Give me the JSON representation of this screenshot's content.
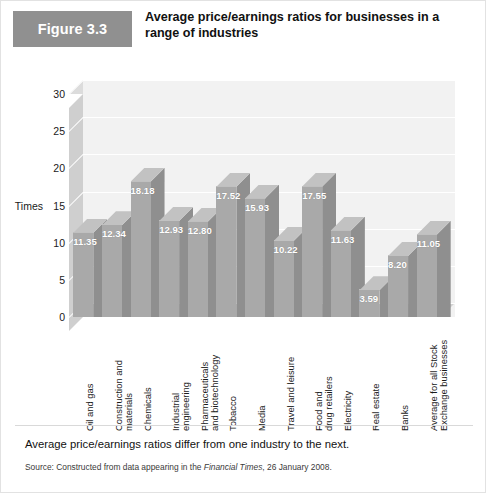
{
  "figure": {
    "tag": "Figure 3.3",
    "title": "Average price/earnings ratios for businesses in a range of industries",
    "caption": "Average price/earnings ratios differ from one industry to the next.",
    "source_prefix": "Source: Constructed from data appearing in the ",
    "source_italic": "Financial Times",
    "source_suffix": ", 26 January 2008."
  },
  "chart_data": {
    "type": "bar",
    "title": "Average price/earnings ratios for businesses in a range of industries",
    "xlabel": "",
    "ylabel": "Times",
    "ylim": [
      0,
      30
    ],
    "yticks": [
      0,
      5,
      10,
      15,
      20,
      25,
      30
    ],
    "grid": true,
    "legend": null,
    "style": "3d-column",
    "categories": [
      "Oil and gas",
      "Construction and materials",
      "Chemicals",
      "Industrial engineering",
      "Pharmaceuticals and biotechnology",
      "Tobacco",
      "Media",
      "Travel and leisure",
      "Food and drug retailers",
      "Electricity",
      "Real estate",
      "Banks",
      "Average for all Stock Exchange businesses"
    ],
    "category_lines": [
      "Oil and gas",
      "Construction and\nmaterials",
      "Chemicals",
      "Industrial\nengineering",
      "Pharmaceuticals\nand biotechnology",
      "Tobacco",
      "Media",
      "Travel and leisure",
      "Food and\ndrug retailers",
      "Electricity",
      "Real estate",
      "Banks",
      "Average for all Stock\nExchange businesses"
    ],
    "values": [
      11.35,
      12.34,
      18.18,
      12.93,
      12.8,
      17.52,
      15.93,
      10.22,
      17.55,
      11.63,
      3.59,
      8.2,
      11.05
    ],
    "value_labels": [
      "11.35",
      "12.34",
      "18.18",
      "12.93",
      "12.80",
      "17.52",
      "15.93",
      "10.22",
      "17.55",
      "11.63",
      "3.59",
      "8.20",
      "11.05"
    ]
  },
  "colors": {
    "tag_bg": "#909090",
    "bar_front": "#a9a9a9",
    "bar_side": "#8f8f8f",
    "bar_top": "#c2c2c2",
    "backwall": "#f2f2f2",
    "floor": "#d2d2d2",
    "gridline": "#ffffff"
  }
}
